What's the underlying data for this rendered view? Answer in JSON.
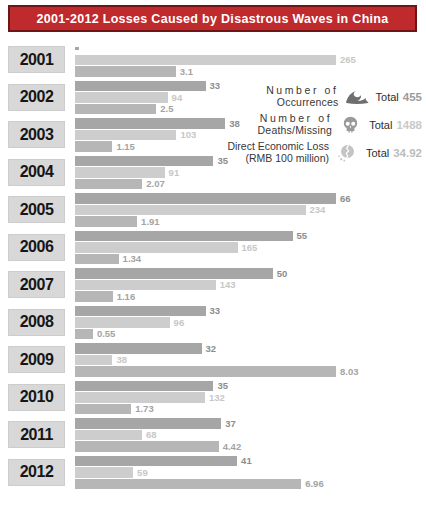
{
  "header": {
    "title": "2001-2012 Losses Caused by Disastrous Waves in China",
    "bg_color": "#bf2a2d",
    "text_color": "#ffffff"
  },
  "legend": {
    "entries": [
      {
        "name": "occurrences",
        "line1": "Number of",
        "line2": "Occurrences",
        "icon": "wave-icon",
        "total_label": "Total",
        "total": "455",
        "value_color": "#9c9c9c"
      },
      {
        "name": "deaths-missing",
        "line1": "Number of",
        "line2": "Deaths/Missing",
        "icon": "skull-icon",
        "total_label": "Total",
        "total": "1488",
        "value_color": "#c9c9c9"
      },
      {
        "name": "direct-economic-loss",
        "line1": "Direct Economic Loss",
        "line2": "(RMB 100 million)",
        "icon": "cracked-coin-icon",
        "total_label": "Total",
        "total": "34.92",
        "value_color": "#bcbcbc"
      }
    ]
  },
  "chart_data": {
    "type": "bar",
    "orientation": "horizontal",
    "title": "2001-2012 Losses Caused by Disastrous Waves in China",
    "categories": [
      "2001",
      "2002",
      "2003",
      "2004",
      "2005",
      "2006",
      "2007",
      "2008",
      "2009",
      "2010",
      "2011",
      "2012"
    ],
    "series": [
      {
        "name": "Number of Occurrences",
        "total": 455,
        "bar_color": "#a6a6a6",
        "label_color": "#8d8d8d",
        "values": [
          0,
          33,
          38,
          35,
          66,
          55,
          50,
          33,
          32,
          35,
          37,
          41
        ]
      },
      {
        "name": "Number of Deaths/Missing",
        "total": 1488,
        "bar_color": "#cdcdcd",
        "label_color": "#c7c7c7",
        "values": [
          265,
          94,
          103,
          91,
          234,
          165,
          143,
          96,
          38,
          132,
          68,
          59
        ]
      },
      {
        "name": "Direct Economic Loss (RMB 100 million)",
        "total": 34.92,
        "bar_color": "#b6b6b6",
        "label_color": "#a4a4a4",
        "values": [
          3.1,
          2.5,
          1.15,
          2.07,
          1.91,
          1.34,
          1.16,
          0.55,
          8.03,
          1.73,
          4.42,
          6.96
        ]
      }
    ],
    "layout": {
      "legend_position": "top-right",
      "each_series_scaled_independently": true,
      "max_bar_px": 261,
      "zero_value_rendering": "tiny stub tick, no label"
    }
  }
}
